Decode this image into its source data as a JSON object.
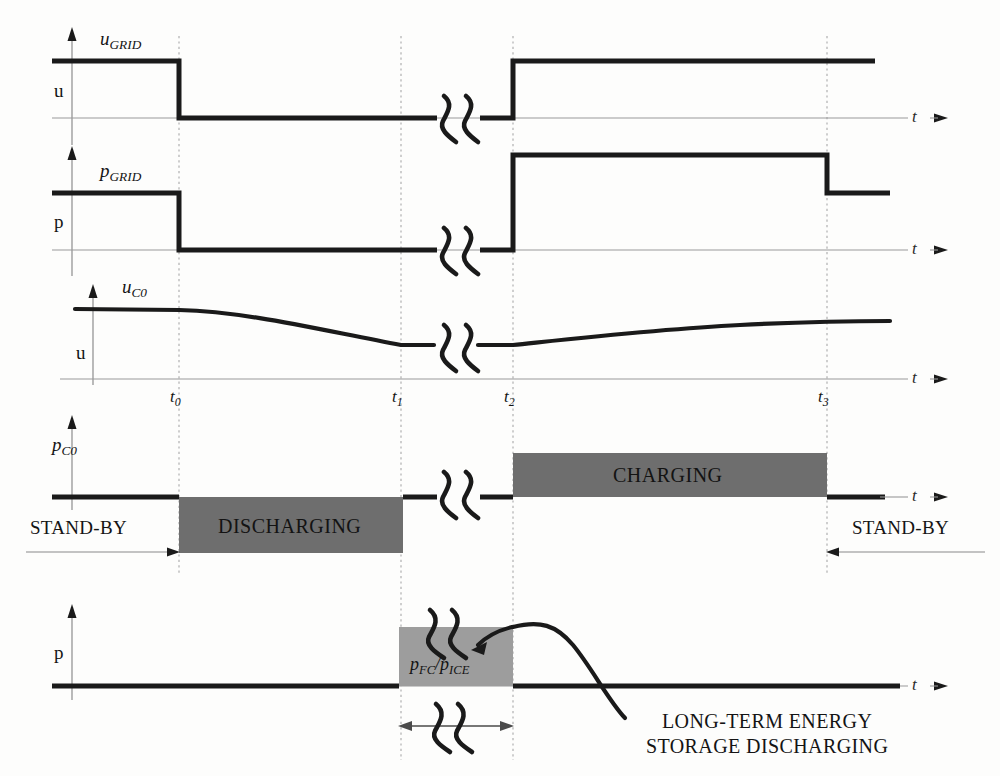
{
  "figure": {
    "kind": "timing-diagram",
    "title_visible": false,
    "background": "#fdfdfc",
    "ink": "#1a1a1a",
    "bar_dark": "#6e6e6e",
    "bar_mid": "#9d9d9d",
    "grid_color": "#a8a8a8"
  },
  "time_axis": {
    "marks": [
      {
        "id": "t0",
        "base": "t",
        "sub": "0",
        "x": 179
      },
      {
        "id": "t1",
        "base": "t",
        "sub": "1",
        "x": 401
      },
      {
        "id": "t2",
        "base": "t",
        "sub": "2",
        "x": 513
      },
      {
        "id": "t3",
        "base": "t",
        "sub": "3",
        "x": 827
      }
    ],
    "axis_symbol": "t",
    "arrow": "→"
  },
  "traces": [
    {
      "name": "u-grid",
      "signal_label_base": "u",
      "signal_label_sub": "GRID",
      "vertical_axis_label": "u",
      "axis_symbol": "t",
      "description": "Grid voltage: high until t0, zero from t0 to t2, high after t2",
      "levels": {
        "high": 1,
        "low": 0
      },
      "events": [
        {
          "at": "start",
          "value": "high"
        },
        {
          "at": "t0",
          "value": "low"
        },
        {
          "at": "t2",
          "value": "high"
        }
      ],
      "break_symbol": true
    },
    {
      "name": "p-grid",
      "signal_label_base": "p",
      "signal_label_sub": "GRID",
      "vertical_axis_label": "p",
      "axis_symbol": "t",
      "description": "Grid power: nominal until t0, zero t0 to t2, elevated t2 to t3, nominal after t3",
      "levels": {
        "high": 1.3,
        "nominal": 1,
        "low": 0
      },
      "events": [
        {
          "at": "start",
          "value": "nominal"
        },
        {
          "at": "t0",
          "value": "low"
        },
        {
          "at": "t2",
          "value": "high"
        },
        {
          "at": "t3",
          "value": "nominal"
        }
      ],
      "break_symbol": true
    },
    {
      "name": "u-c0",
      "signal_label_base": "u",
      "signal_label_sub": "C0",
      "vertical_axis_label": "u",
      "axis_symbol": "t",
      "description": "Capacitor voltage: flat, sags from t0 down to minimum at t1, stays at minimum until t2, recovers gradually after t2",
      "break_symbol": true
    },
    {
      "name": "p-c0",
      "signal_label_base": "p",
      "signal_label_sub": "C0",
      "vertical_axis_label": "",
      "axis_symbol": "t",
      "description": "Capacitor power: zero (stand-by), negative block t0-t1 labelled DISCHARGING, zero, positive block t2-t3 labelled CHARGING, zero (stand-by)",
      "break_symbol": true,
      "blocks": [
        {
          "label": "DISCHARGING",
          "from": "t0",
          "to": "t1",
          "sign": "negative"
        },
        {
          "label": "CHARGING",
          "from": "t2",
          "to": "t3",
          "sign": "positive"
        }
      ],
      "annotations": [
        {
          "text": "STAND-BY",
          "side": "left",
          "to_mark": "t0"
        },
        {
          "text": "STAND-BY",
          "side": "right",
          "from_mark": "t3"
        }
      ]
    },
    {
      "name": "p-fc-ice",
      "signal_label_base": "",
      "signal_label_sub": "",
      "vertical_axis_label": "p",
      "axis_symbol": "t",
      "description": "Long-term storage power: zero, rectangular block t1-t2 labelled p_FC / p_ICE, then a decaying hump falling below zero after t2",
      "block": {
        "label_base_1": "p",
        "label_sub_1": "FC",
        "separator": "/",
        "label_base_2": "p",
        "label_sub_2": "ICE",
        "from": "t1",
        "to": "t2"
      },
      "dimension_arrow": {
        "from": "t1",
        "to": "t2"
      },
      "callout": {
        "line1": "LONG-TERM ENERGY",
        "line2": "STORAGE DISCHARGING"
      }
    }
  ],
  "labels": {
    "u_grid_base": "u",
    "u_grid_sub": "GRID",
    "p_grid_base": "p",
    "p_grid_sub": "GRID",
    "u_c0_base": "u",
    "u_c0_sub": "C0",
    "p_c0_base": "p",
    "p_c0_sub": "C0",
    "axis_u_1": "u",
    "axis_p_1": "p",
    "axis_u_2": "u",
    "axis_p_2": "p",
    "t_axis_1": "t",
    "t_axis_2": "t",
    "t_axis_3": "t",
    "t_axis_4": "t",
    "t_axis_5": "t",
    "standby_left": "STAND-BY",
    "standby_right": "STAND-BY",
    "discharging": "DISCHARGING",
    "charging": "CHARGING",
    "pfc_base": "p",
    "pfc_sub": "FC",
    "slash": "/",
    "pice_base": "p",
    "pice_sub": "ICE",
    "callout_line1": "LONG-TERM ENERGY",
    "callout_line2": "STORAGE DISCHARGING",
    "t0_base": "t",
    "t0_sub": "0",
    "t1_base": "t",
    "t1_sub": "1",
    "t2_base": "t",
    "t2_sub": "2",
    "t3_base": "t",
    "t3_sub": "3"
  }
}
